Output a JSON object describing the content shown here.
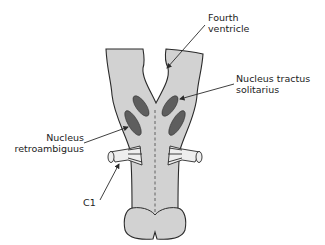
{
  "diagram": {
    "colors": {
      "tissue": "#d2d2d2",
      "outline": "#2a2a2a",
      "nucleus": "#5e5e5e",
      "nerve": "#eeeeee",
      "text": "#222222"
    },
    "labels": {
      "fourth_ventricle": [
        "Fourth",
        "ventricle"
      ],
      "nts": [
        "Nucleus tractus",
        "solitarius"
      ],
      "nra": [
        "Nucleus",
        "retroambiguus"
      ],
      "c1": "C1"
    }
  }
}
